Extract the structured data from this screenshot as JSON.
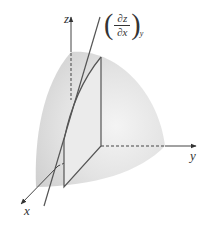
{
  "figure": {
    "type": "3d-surface-partial-derivative",
    "axes": {
      "x_label": "x",
      "y_label": "y",
      "z_label": "z"
    },
    "annotation": {
      "numerator": "∂z",
      "denominator": "∂x",
      "subscript": "y",
      "left_paren": "(",
      "right_paren": ")"
    },
    "colors": {
      "surface_light": "#f2f2f2",
      "surface_dark": "#d2d2d2",
      "line": "#555555",
      "axis": "#444444",
      "background": "#ffffff"
    }
  }
}
